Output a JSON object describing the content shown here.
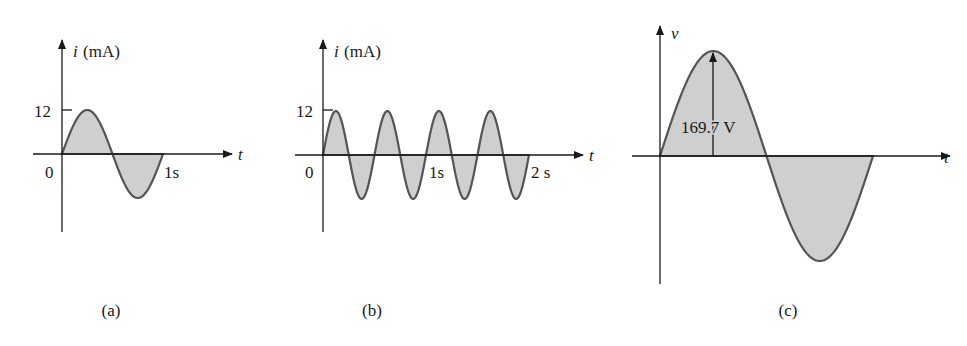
{
  "figure": {
    "panels": [
      {
        "id": "a",
        "caption": "(a)",
        "y_axis_label_var": "i",
        "y_axis_label_unit": "(mA)",
        "x_axis_label": "t",
        "y_tick": "12",
        "origin": "0",
        "x_end_label": "1s",
        "cycles": 1
      },
      {
        "id": "b",
        "caption": "(b)",
        "y_axis_label_var": "i",
        "y_axis_label_unit": "(mA)",
        "x_axis_label": "t",
        "y_tick": "12",
        "origin": "0",
        "x_mid_label": "1s",
        "x_end_label": "2 s",
        "cycles": 4
      },
      {
        "id": "c",
        "caption": "(c)",
        "y_axis_label_var": "v",
        "x_axis_label": "t",
        "peak_label": "169.7 V",
        "cycles": 1
      }
    ],
    "colors": {
      "fill": "#cfcfcf",
      "stroke": "#555555",
      "axis": "#1a1a1a"
    }
  },
  "chart_data": [
    {
      "type": "line",
      "title": "(a)",
      "xlabel": "t",
      "ylabel": "i (mA)",
      "series": [
        {
          "name": "i(t)",
          "amplitude": 12,
          "period_s": 1,
          "cycles": 1
        }
      ],
      "x_ticks": [
        "0",
        "1s"
      ],
      "y_ticks": [
        "12"
      ]
    },
    {
      "type": "line",
      "title": "(b)",
      "xlabel": "t",
      "ylabel": "i (mA)",
      "series": [
        {
          "name": "i(t)",
          "amplitude": 12,
          "period_s": 0.5,
          "cycles": 4
        }
      ],
      "x_ticks": [
        "0",
        "1s",
        "2 s"
      ],
      "y_ticks": [
        "12"
      ]
    },
    {
      "type": "line",
      "title": "(c)",
      "xlabel": "t",
      "ylabel": "v",
      "series": [
        {
          "name": "v(t)",
          "amplitude": 169.7,
          "cycles": 1
        }
      ],
      "annotations": [
        "169.7 V"
      ]
    }
  ]
}
